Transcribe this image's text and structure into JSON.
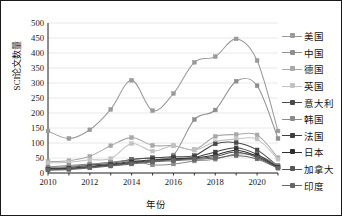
{
  "chart_data": {
    "type": "line",
    "title": "",
    "xlabel": "年份",
    "ylabel": "SCI论文数量",
    "x": [
      2010,
      2011,
      2012,
      2013,
      2014,
      2015,
      2016,
      2017,
      2018,
      2019,
      2020,
      2021
    ],
    "xtick_labels": [
      "2010",
      "",
      "2012",
      "",
      "2014",
      "",
      "2016",
      "",
      "2018",
      "",
      "2020",
      ""
    ],
    "ytick_labels": [
      "0",
      "50",
      "100",
      "150",
      "200",
      "250",
      "300",
      "350",
      "400",
      "450",
      "500"
    ],
    "xlim": [
      2010,
      2021
    ],
    "ylim": [
      0,
      500
    ],
    "grid": "horizontal",
    "legend_position": "right",
    "series": [
      {
        "name": "美国",
        "color": "#9a9a9a",
        "values": [
          140,
          115,
          144,
          212,
          309,
          208,
          265,
          369,
          388,
          447,
          375,
          140
        ]
      },
      {
        "name": "中国",
        "color": "#8e8e8e",
        "values": [
          18,
          22,
          28,
          36,
          44,
          52,
          60,
          178,
          210,
          306,
          291,
          115
        ]
      },
      {
        "name": "德国",
        "color": "#a8a8a8",
        "values": [
          38,
          41,
          56,
          91,
          118,
          92,
          91,
          78,
          122,
          128,
          127,
          51
        ]
      },
      {
        "name": "英国",
        "color": "#c2c2c2",
        "values": [
          34,
          36,
          44,
          48,
          98,
          73,
          91,
          76,
          104,
          113,
          113,
          46
        ]
      },
      {
        "name": "意大利",
        "color": "#4a4a4a",
        "values": [
          14,
          18,
          26,
          32,
          45,
          50,
          54,
          58,
          97,
          101,
          77,
          22
        ]
      },
      {
        "name": "韩国",
        "color": "#8a8a8a",
        "values": [
          20,
          25,
          30,
          35,
          41,
          27,
          30,
          40,
          46,
          63,
          59,
          26
        ]
      },
      {
        "name": "法国",
        "color": "#3f3f3f",
        "values": [
          13,
          16,
          22,
          29,
          38,
          44,
          48,
          52,
          70,
          84,
          62,
          20
        ]
      },
      {
        "name": "日本",
        "color": "#2e2e2e",
        "values": [
          12,
          14,
          20,
          27,
          35,
          42,
          46,
          50,
          60,
          76,
          56,
          18
        ]
      },
      {
        "name": "加拿大",
        "color": "#555555",
        "values": [
          11,
          13,
          19,
          25,
          33,
          40,
          44,
          48,
          55,
          70,
          52,
          17
        ]
      },
      {
        "name": "印度",
        "color": "#666666",
        "values": [
          10,
          12,
          17,
          23,
          30,
          37,
          41,
          45,
          50,
          58,
          47,
          16
        ]
      }
    ]
  },
  "axes": {
    "ylabel_text": "SCI论文数量",
    "xlabel_text": "年份"
  }
}
